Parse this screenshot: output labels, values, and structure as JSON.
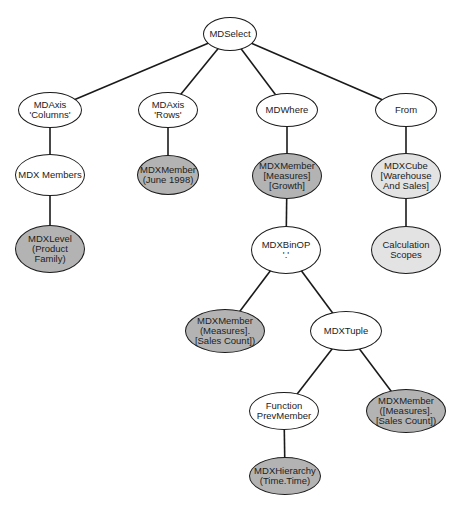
{
  "diagram": {
    "colors": {
      "white": "#ffffff",
      "dark": "#b3b3b3",
      "light": "#e3e3e3",
      "line": "#1a1a1a"
    },
    "nodes": [
      {
        "id": "mdselect",
        "label": "MDSelect",
        "fill": "white",
        "cx": 230,
        "cy": 34,
        "w": 54,
        "h": 34
      },
      {
        "id": "mdaxis-columns",
        "label": "MDAxis\n'Columns'",
        "fill": "white",
        "cx": 50,
        "cy": 110,
        "w": 64,
        "h": 36
      },
      {
        "id": "mdaxis-rows",
        "label": "MDAxis\n'Rows'",
        "fill": "white",
        "cx": 168,
        "cy": 110,
        "w": 60,
        "h": 36
      },
      {
        "id": "mdwhere",
        "label": "MDWhere",
        "fill": "white",
        "cx": 287,
        "cy": 110,
        "w": 62,
        "h": 34
      },
      {
        "id": "from",
        "label": "From",
        "fill": "white",
        "cx": 406,
        "cy": 110,
        "w": 62,
        "h": 34
      },
      {
        "id": "mdx-members",
        "label": "MDX Members",
        "fill": "white",
        "cx": 50,
        "cy": 175,
        "w": 70,
        "h": 42
      },
      {
        "id": "mdxmember-june",
        "label": "MDXMember\n(June 1998)",
        "fill": "dark",
        "cx": 168,
        "cy": 175,
        "w": 62,
        "h": 40
      },
      {
        "id": "mdxmember-growth",
        "label": "MDXMember\n[Measures]\n[Growth]",
        "fill": "dark",
        "cx": 287,
        "cy": 176,
        "w": 70,
        "h": 46
      },
      {
        "id": "mdxcube",
        "label": "MDXCube\n[Warehouse\nAnd Sales]",
        "fill": "light",
        "cx": 406,
        "cy": 176,
        "w": 70,
        "h": 46
      },
      {
        "id": "mdxlevel",
        "label": "MDXLevel\n(Product\nFamily)",
        "fill": "dark",
        "cx": 50,
        "cy": 249,
        "w": 70,
        "h": 48
      },
      {
        "id": "mdxbinop",
        "label": "MDXBinOP\n'.'",
        "fill": "white",
        "cx": 286,
        "cy": 250,
        "w": 70,
        "h": 48
      },
      {
        "id": "calculation-scopes",
        "label": "Calculation\nScopes",
        "fill": "light",
        "cx": 406,
        "cy": 250,
        "w": 70,
        "h": 48
      },
      {
        "id": "mdxmember-salescount-1",
        "label": "MDXMember\n(Measures].\n[Sales Count])",
        "fill": "dark",
        "cx": 225,
        "cy": 331,
        "w": 80,
        "h": 44
      },
      {
        "id": "mdxtuple",
        "label": "MDXTuple",
        "fill": "white",
        "cx": 346,
        "cy": 331,
        "w": 72,
        "h": 40
      },
      {
        "id": "function-prevmember",
        "label": "Function\nPrevMember",
        "fill": "white",
        "cx": 284,
        "cy": 411,
        "w": 70,
        "h": 38
      },
      {
        "id": "mdxmember-salescount-2",
        "label": "MDXMember\n([Measures].\n[Sales Count])",
        "fill": "dark",
        "cx": 406,
        "cy": 411,
        "w": 80,
        "h": 44
      },
      {
        "id": "mdxhierarchy",
        "label": "MDXHierarchy\n(Time.Time)",
        "fill": "dark",
        "cx": 285,
        "cy": 476,
        "w": 72,
        "h": 38
      }
    ],
    "edges": [
      [
        "mdselect",
        "mdaxis-columns"
      ],
      [
        "mdselect",
        "mdaxis-rows"
      ],
      [
        "mdselect",
        "mdwhere"
      ],
      [
        "mdselect",
        "from"
      ],
      [
        "mdaxis-columns",
        "mdx-members"
      ],
      [
        "mdaxis-rows",
        "mdxmember-june"
      ],
      [
        "mdwhere",
        "mdxmember-growth"
      ],
      [
        "from",
        "mdxcube"
      ],
      [
        "mdx-members",
        "mdxlevel"
      ],
      [
        "mdxmember-growth",
        "mdxbinop"
      ],
      [
        "mdxcube",
        "calculation-scopes"
      ],
      [
        "mdxbinop",
        "mdxmember-salescount-1"
      ],
      [
        "mdxbinop",
        "mdxtuple"
      ],
      [
        "mdxtuple",
        "function-prevmember"
      ],
      [
        "mdxtuple",
        "mdxmember-salescount-2"
      ],
      [
        "function-prevmember",
        "mdxhierarchy"
      ]
    ]
  }
}
